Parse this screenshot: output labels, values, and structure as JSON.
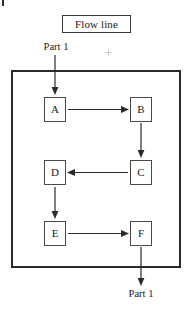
{
  "figure": {
    "title_box": {
      "label": "Flow line"
    },
    "input_label": "Part 1",
    "output_label": "Part 1",
    "nodes": [
      {
        "id": "A",
        "label": "A"
      },
      {
        "id": "B",
        "label": "B"
      },
      {
        "id": "C",
        "label": "C"
      },
      {
        "id": "D",
        "label": "D"
      },
      {
        "id": "E",
        "label": "E"
      },
      {
        "id": "F",
        "label": "F"
      }
    ],
    "flow_sequence": "Part 1 → A → B → C → D → E → F → Part 1",
    "colors": {
      "line": "#2b2b2b",
      "node_border": "#4a4a4a",
      "background": "#ffffff"
    },
    "marks": {
      "corner_tick": "corner-tick-mark",
      "crosshair": "registration-crosshair"
    }
  }
}
